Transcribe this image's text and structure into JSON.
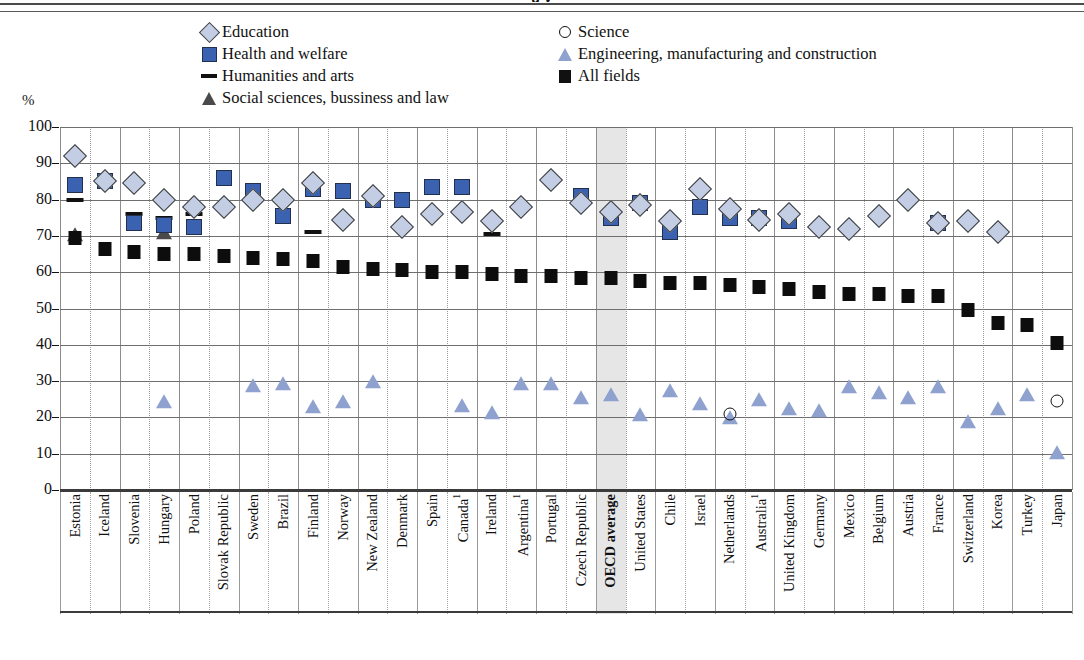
{
  "page": {
    "title_fragment": "g y",
    "y_axis_unit": "%"
  },
  "legend": {
    "items": [
      {
        "label": "Education",
        "marker": "diamond-icon",
        "color": "#c3cee4",
        "col": 0,
        "row": 0
      },
      {
        "label": "Science",
        "marker": "open-circle-icon",
        "color": "#ffffff",
        "col": 1,
        "row": 0
      },
      {
        "label": "Health and welfare",
        "marker": "square-icon",
        "color": "#3b62b0",
        "col": 0,
        "row": 1
      },
      {
        "label": "Engineering, manufacturing and construction",
        "marker": "triangle-icon",
        "color": "#8fa1ce",
        "col": 1,
        "row": 1
      },
      {
        "label": "Humanities and arts",
        "marker": "dash-icon",
        "color": "#111111",
        "col": 0,
        "row": 2
      },
      {
        "label": "All fields",
        "marker": "filled-square-icon",
        "color": "#111111",
        "col": 1,
        "row": 2
      },
      {
        "label": "Social sciences, bussiness and law",
        "marker": "dark-triangle-icon",
        "color": "#4a4a4a",
        "col": 0,
        "row": 3
      }
    ]
  },
  "chart_data": {
    "type": "scatter",
    "title": "",
    "xlabel": "",
    "ylabel": "%",
    "ylim": [
      0,
      100
    ],
    "yticks": [
      0,
      10,
      20,
      30,
      40,
      50,
      60,
      70,
      80,
      90,
      100
    ],
    "grid": true,
    "legend_position": "top",
    "highlight_category": "OECD average",
    "footnote_marker": "1",
    "categories": [
      "Estonia",
      "Iceland",
      "Slovenia",
      "Hungary",
      "Poland",
      "Slovak Republic",
      "Sweden",
      "Brazil",
      "Finland",
      "Norway",
      "New Zealand",
      "Denmark",
      "Spain",
      "Canada",
      "Ireland",
      "Argentina",
      "Portugal",
      "Czech Republic",
      "OECD average",
      "United States",
      "Chile",
      "Israel",
      "Netherlands",
      "Australia",
      "United Kingdom",
      "Germany",
      "Mexico",
      "Belgium",
      "Austria",
      "France",
      "Switzerland",
      "Korea",
      "Turkey",
      "Japan"
    ],
    "category_footnotes": {
      "Canada": "1",
      "Argentina": "1",
      "Australia": "1"
    },
    "series": [
      {
        "name": "Education",
        "marker": "diamond",
        "color": "#c3cee4",
        "values": [
          92,
          85,
          84.5,
          80,
          78,
          78,
          80,
          80,
          84.5,
          74.5,
          81,
          72.5,
          76,
          76.5,
          74,
          78,
          85.5,
          79,
          76.5,
          78.5,
          74,
          83,
          77.5,
          74.5,
          76,
          72.5,
          72,
          75.5,
          80,
          73.5,
          74,
          71,
          null,
          null
        ]
      },
      {
        "name": "Health and welfare",
        "marker": "square",
        "color": "#3b62b0",
        "values": [
          84,
          85,
          73.5,
          73,
          72.5,
          86,
          82.5,
          75.5,
          83,
          82.5,
          80,
          80,
          83.5,
          83.5,
          null,
          null,
          null,
          81,
          75,
          79,
          71,
          78,
          75,
          75,
          74,
          null,
          null,
          null,
          null,
          73.5,
          null,
          null,
          null,
          null
        ]
      },
      {
        "name": "Humanities and arts",
        "marker": "dash",
        "color": "#111111",
        "values": [
          80,
          null,
          76,
          75,
          76,
          null,
          null,
          null,
          71,
          null,
          null,
          null,
          null,
          null,
          70.5,
          null,
          null,
          null,
          null,
          null,
          null,
          null,
          null,
          null,
          null,
          null,
          null,
          null,
          null,
          73,
          null,
          null,
          null,
          null
        ]
      },
      {
        "name": "Social sciences, bussiness and law",
        "marker": "dark-triangle",
        "color": "#4a4a4a",
        "values": [
          70,
          null,
          null,
          70.5,
          null,
          null,
          null,
          null,
          null,
          null,
          null,
          null,
          null,
          null,
          null,
          null,
          null,
          null,
          null,
          null,
          null,
          null,
          null,
          null,
          null,
          null,
          null,
          null,
          null,
          null,
          null,
          null,
          null,
          null
        ]
      },
      {
        "name": "Science",
        "marker": "open-circle",
        "color": "#ffffff",
        "values": [
          null,
          null,
          null,
          null,
          null,
          null,
          null,
          null,
          null,
          null,
          null,
          null,
          null,
          null,
          null,
          null,
          null,
          null,
          null,
          null,
          null,
          null,
          21,
          null,
          null,
          null,
          null,
          null,
          null,
          null,
          null,
          null,
          null,
          24.5
        ]
      },
      {
        "name": "Engineering, manufacturing and construction",
        "marker": "triangle",
        "color": "#8fa1ce",
        "values": [
          null,
          null,
          null,
          24,
          null,
          null,
          28.5,
          29,
          22.5,
          24,
          29.5,
          null,
          null,
          23,
          21,
          29,
          29,
          25,
          26,
          20.5,
          27,
          23.5,
          19.5,
          24.5,
          22,
          21.5,
          28,
          26.5,
          25,
          28,
          18.5,
          22,
          26,
          10
        ]
      },
      {
        "name": "All fields",
        "marker": "filled-square",
        "color": "#0d0d0d",
        "values": [
          69.5,
          66.5,
          65.5,
          65,
          65,
          64.5,
          64,
          63.5,
          63,
          61.5,
          61,
          60.5,
          60,
          60,
          59.5,
          59,
          59,
          58.5,
          58.5,
          57.5,
          57,
          57,
          56.5,
          56,
          55.5,
          54.5,
          54,
          54,
          53.5,
          53.5,
          49.5,
          46,
          45.5,
          40.5
        ]
      }
    ]
  }
}
